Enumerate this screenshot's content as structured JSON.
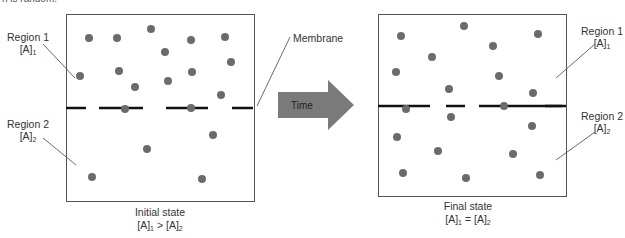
{
  "header_fragment": "n is random.",
  "left_panel": {
    "region1_label": "Region 1",
    "region1_conc": "[A]",
    "region1_sub": "1",
    "region2_label": "Region 2",
    "region2_conc": "[A]",
    "region2_sub": "2",
    "caption_title": "Initial state",
    "caption_expr_a": "[A]",
    "caption_expr_a_sub": "1",
    "caption_op": " > ",
    "caption_expr_b": "[A]",
    "caption_expr_b_sub": "2"
  },
  "membrane_label": "Membrane",
  "arrow_label": "Time",
  "right_panel": {
    "region1_label": "Region 1",
    "region1_conc": "[A]",
    "region1_sub": "1",
    "region2_label": "Region 2",
    "region2_conc": "[A]",
    "region2_sub": "2",
    "caption_title": "Final state",
    "caption_expr_a": "[A]",
    "caption_expr_a_sub": "1",
    "caption_op": " = ",
    "caption_expr_b": "[A]",
    "caption_expr_b_sub": "2"
  },
  "colors": {
    "particle": "#6b6b6b",
    "arrow_fill": "#7a7a7a",
    "membrane": "#111111",
    "box_border": "#555555"
  },
  "particle_counts": {
    "left_region1": 13,
    "left_region2": 4,
    "left_on_membrane": 2,
    "right_region1": 9,
    "right_region2": 9,
    "right_on_membrane": 2
  }
}
